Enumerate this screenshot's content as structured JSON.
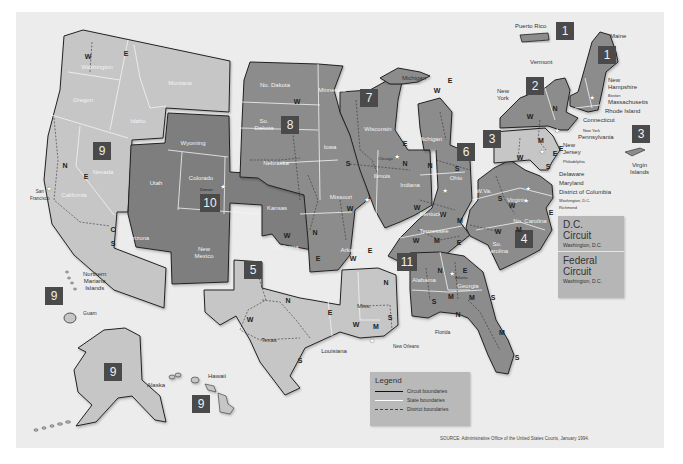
{
  "map": {
    "title": "U.S. Courts of Appeals and District Court Circuits",
    "colors": {
      "background": "#ececec",
      "circuit_light": "#c8c8c8",
      "circuit_medium": "#8c8c8c",
      "circuit_dark": "#7c7c7c",
      "badge": "#4a4a4a",
      "dc_box": "#b6b6b6",
      "legend_box": "#b9b9b9"
    },
    "circuit_badges": [
      {
        "number": "1",
        "location": "Puerto Rico"
      },
      {
        "number": "1",
        "location": "Maine"
      },
      {
        "number": "2",
        "location": "New York"
      },
      {
        "number": "3",
        "location": "Pennsylvania"
      },
      {
        "number": "3",
        "location": "Virgin Islands"
      },
      {
        "number": "4",
        "location": "No. Carolina"
      },
      {
        "number": "5",
        "location": "Texas"
      },
      {
        "number": "6",
        "location": "Ohio"
      },
      {
        "number": "7",
        "location": "Wisconsin"
      },
      {
        "number": "8",
        "location": "So. Dakota"
      },
      {
        "number": "9",
        "location": "Nevada"
      },
      {
        "number": "9",
        "location": "Northern Mariana Islands"
      },
      {
        "number": "9",
        "location": "Alaska"
      },
      {
        "number": "9",
        "location": "Hawaii"
      },
      {
        "number": "10",
        "location": "Colorado"
      },
      {
        "number": "11",
        "location": "Alabama"
      }
    ],
    "state_labels": {
      "washington": "Washington",
      "oregon": "Oregon",
      "idaho": "Idaho",
      "montana": "Montana",
      "nevada": "Nevada",
      "california": "California",
      "arizona": "Arizona",
      "wyoming": "Wyoming",
      "utah": "Utah",
      "colorado": "Colorado",
      "new_mexico": "New\nMexico",
      "kansas": "Kansas",
      "oklahoma": "Oklahoma",
      "no_dakota": "No. Dakota",
      "so_dakota": "So.\nDakota",
      "nebraska": "Nebraska",
      "minnesota": "Minnesota",
      "iowa": "Iowa",
      "missouri": "Missouri",
      "arkansas": "Arkansas",
      "wisconsin": "Wisconsin",
      "illinois": "Illinois",
      "indiana": "Indiana",
      "michigan": "Michigan",
      "ohio": "Ohio",
      "kentucky": "Kentucky",
      "tennessee": "Tennessee",
      "texas": "Texas",
      "louisiana": "Louisiana",
      "miss": "Miss.",
      "alabama": "Alabama",
      "georgia": "Georgia",
      "w_va": "W.Va.",
      "virginia": "Virginia",
      "no_carolina": "No. Carolina",
      "so_carolina": "So.\nCarolina"
    },
    "callout_labels": {
      "puerto_rico": "Puerto Rico",
      "maine": "Maine",
      "vermont": "Vermont",
      "new_york": "New\nYork",
      "new_hampshire": "New\nHampshire",
      "boston": "Boston",
      "massachusetts": "Massachusetts",
      "rhode_island": "Rhode Island",
      "connecticut": "Connecticut",
      "new_york_city": "New York",
      "pennsylvania": "Pennsylvania",
      "new_jersey": "New\nJersey",
      "philadelphia": "Philadelphia",
      "delaware": "Delaware",
      "maryland": "Maryland",
      "district_of_columbia": "District of Columbia",
      "washington_dc": "Washington, D.C.",
      "richmond": "Richmond",
      "virgin_islands": "Virgin\nIslands",
      "michigan_upper": "Michigan",
      "chicago": "Chicago",
      "cincinnati": "Cincinnati",
      "st_louis": "St. Louis",
      "san_francisco": "San\nFrancisco",
      "denver": "Denver",
      "new_orleans": "New Orleans",
      "atlanta": "Atlanta",
      "florida": "Florida",
      "northern_mariana": "Northern\nMariana\nIslands",
      "guam": "Guam",
      "alaska": "Alaska",
      "hawaii": "Hawaii"
    },
    "district_markers": [
      {
        "text": "W",
        "x": 88,
        "y": 56
      },
      {
        "text": "E",
        "x": 126,
        "y": 53
      },
      {
        "text": "N",
        "x": 65,
        "y": 165
      },
      {
        "text": "E",
        "x": 86,
        "y": 176
      },
      {
        "text": "C",
        "x": 113,
        "y": 229
      },
      {
        "text": "S",
        "x": 113,
        "y": 243
      },
      {
        "text": "W",
        "x": 297,
        "y": 101
      },
      {
        "text": "E",
        "x": 405,
        "y": 143
      },
      {
        "text": "S",
        "x": 348,
        "y": 163
      },
      {
        "text": "N",
        "x": 405,
        "y": 163
      },
      {
        "text": "N",
        "x": 430,
        "y": 165
      },
      {
        "text": "E",
        "x": 450,
        "y": 80
      },
      {
        "text": "W",
        "x": 437,
        "y": 90
      },
      {
        "text": "S",
        "x": 457,
        "y": 168
      },
      {
        "text": "W",
        "x": 350,
        "y": 208
      },
      {
        "text": "W",
        "x": 353,
        "y": 258
      },
      {
        "text": "E",
        "x": 370,
        "y": 250
      },
      {
        "text": "W",
        "x": 287,
        "y": 235
      },
      {
        "text": "N",
        "x": 315,
        "y": 232
      },
      {
        "text": "E",
        "x": 318,
        "y": 258
      },
      {
        "text": "N",
        "x": 288,
        "y": 300
      },
      {
        "text": "W",
        "x": 250,
        "y": 319
      },
      {
        "text": "E",
        "x": 330,
        "y": 312
      },
      {
        "text": "S",
        "x": 300,
        "y": 360
      },
      {
        "text": "N",
        "x": 386,
        "y": 282
      },
      {
        "text": "S",
        "x": 390,
        "y": 317
      },
      {
        "text": "W",
        "x": 356,
        "y": 324
      },
      {
        "text": "M",
        "x": 376,
        "y": 326
      },
      {
        "text": "W",
        "x": 417,
        "y": 207
      },
      {
        "text": "W",
        "x": 443,
        "y": 214
      },
      {
        "text": "M",
        "x": 460,
        "y": 220
      },
      {
        "text": "W",
        "x": 416,
        "y": 240
      },
      {
        "text": "E",
        "x": 459,
        "y": 242
      },
      {
        "text": "M",
        "x": 437,
        "y": 240
      },
      {
        "text": "E",
        "x": 465,
        "y": 270
      },
      {
        "text": "S",
        "x": 500,
        "y": 198
      },
      {
        "text": "W",
        "x": 512,
        "y": 205
      },
      {
        "text": "E",
        "x": 551,
        "y": 212
      },
      {
        "text": "W",
        "x": 498,
        "y": 231
      },
      {
        "text": "M",
        "x": 519,
        "y": 229
      },
      {
        "text": "N",
        "x": 440,
        "y": 270
      },
      {
        "text": "S",
        "x": 434,
        "y": 301
      },
      {
        "text": "M",
        "x": 451,
        "y": 296
      },
      {
        "text": "M",
        "x": 472,
        "y": 297
      },
      {
        "text": "S",
        "x": 493,
        "y": 297
      },
      {
        "text": "N",
        "x": 458,
        "y": 314
      },
      {
        "text": "M",
        "x": 502,
        "y": 332
      },
      {
        "text": "S",
        "x": 517,
        "y": 357
      },
      {
        "text": "W",
        "x": 530,
        "y": 116
      },
      {
        "text": "N",
        "x": 555,
        "y": 108
      },
      {
        "text": "E",
        "x": 561,
        "y": 148
      },
      {
        "text": "W",
        "x": 520,
        "y": 157
      },
      {
        "text": "M",
        "x": 541,
        "y": 140
      },
      {
        "text": "E",
        "x": 555,
        "y": 153
      },
      {
        "text": "S",
        "x": 548,
        "y": 166
      }
    ],
    "special_circuits": [
      {
        "title": "D.C.\nCircuit",
        "location": "Washington, D.C."
      },
      {
        "title": "Federal\nCircuit",
        "location": "Washington, D.C."
      }
    ],
    "legend": {
      "title": "Legend",
      "items": [
        {
          "label": "Circuit boundaries",
          "style": "solid-black"
        },
        {
          "label": "State boundaries",
          "style": "solid-white"
        },
        {
          "label": "District boundaries",
          "style": "dashed"
        }
      ]
    },
    "source": "SOURCE: Administrative Office of the United States Courts, January 1994."
  }
}
